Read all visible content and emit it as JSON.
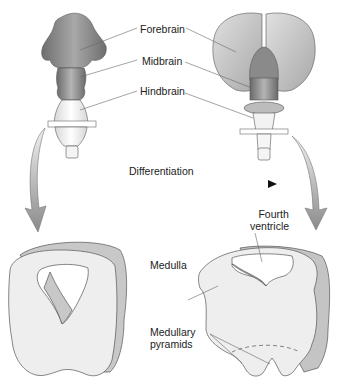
{
  "diagram": {
    "labels": {
      "forebrain": "Forebrain",
      "midbrain": "Midbrain",
      "hindbrain": "Hindbrain",
      "differentiation": "Differentiation",
      "fourth_ventricle_line1": "Fourth",
      "fourth_ventricle_line2": "ventricle",
      "medulla": "Medulla",
      "medullary_pyramids_line1": "Medullary",
      "medullary_pyramids_line2": "pyramids"
    },
    "colors": {
      "forebrain_early": "#8c8c8c",
      "midbrain_early": "#9a9a9a",
      "hindbrain_early": "#f2f2f2",
      "forebrain_late": "#c4c4c4",
      "midbrain_late": "#7e7e7e",
      "tissue": "#eeeeee",
      "tissue_side": "#bdbdbd",
      "outline": "#555555",
      "arrow": "#9a9a9a",
      "label_text": "#222222"
    }
  }
}
